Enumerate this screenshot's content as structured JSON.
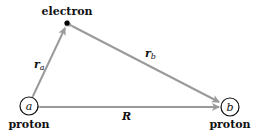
{
  "diagram": {
    "electron_label": "electron",
    "proton_a": {
      "letter": "a",
      "label": "proton"
    },
    "proton_b": {
      "letter": "b",
      "label": "proton"
    },
    "vectors": {
      "ra": {
        "main": "r",
        "sub": "a"
      },
      "rb": {
        "main": "r",
        "sub": "b"
      },
      "R": {
        "main": "R"
      }
    },
    "colors": {
      "arrow": "#9a9a9a",
      "text": "#111111"
    }
  }
}
